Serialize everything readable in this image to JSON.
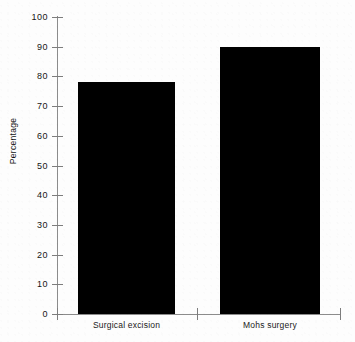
{
  "chart_data": {
    "type": "bar",
    "title": "",
    "subtitle": "",
    "xlabel": "",
    "ylabel": "Percentage",
    "categories": [
      "Surgical excision",
      "Mohs surgery"
    ],
    "values": [
      78,
      90
    ],
    "ylim": [
      0,
      100
    ],
    "y_ticks": [
      0,
      10,
      20,
      30,
      40,
      50,
      60,
      70,
      80,
      90,
      100
    ],
    "y_tick_labels": [
      "0",
      "10",
      "20",
      "30",
      "40",
      "50",
      "60",
      "70",
      "80",
      "90",
      "100"
    ],
    "grid": false,
    "legend": null,
    "legend_position": "none",
    "series": [
      {
        "name": "Percentage",
        "values": [
          78,
          90
        ],
        "color": "#000000"
      }
    ],
    "annotations": []
  },
  "axes": {
    "y_title": "Percentage",
    "x_title": ""
  },
  "colors": {
    "bar_fill": "#000000",
    "axis": "#8c8c8c",
    "tick": "#7d7d7d",
    "text": "#161616",
    "background": "#fdfdfd"
  }
}
